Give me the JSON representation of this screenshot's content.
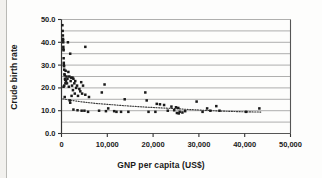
{
  "chart_data": {
    "type": "scatter",
    "title": "",
    "xlabel": "GNP per capita (US$)",
    "ylabel": "Crude birth rate",
    "xlim": [
      0,
      50000
    ],
    "ylim": [
      0,
      50
    ],
    "xticks": [
      0,
      10000,
      20000,
      30000,
      40000,
      50000
    ],
    "xticklabels": [
      "0",
      "10,000",
      "20,000",
      "30,000",
      "40,000",
      "50,000"
    ],
    "yticks": [
      0,
      10,
      20,
      30,
      40,
      50
    ],
    "yticklabels": [
      "0.0",
      "10.0",
      "20.0",
      "30.0",
      "40.0",
      "50.0"
    ],
    "grid": "horizontal gridlines every 5 units",
    "gridlines_y": [
      5,
      10,
      15,
      20,
      25,
      30,
      35,
      40,
      45,
      50
    ],
    "marker": "filled-square",
    "marker_color": "#1a1a1a",
    "legend": "none",
    "series": [
      {
        "name": "Countries",
        "points": [
          [
            200,
            47.5
          ],
          [
            250,
            45.0
          ],
          [
            300,
            43.0
          ],
          [
            320,
            41.5
          ],
          [
            350,
            41.0
          ],
          [
            380,
            40.0
          ],
          [
            1400,
            40.0
          ],
          [
            400,
            38.0
          ],
          [
            5200,
            38.0
          ],
          [
            420,
            37.0
          ],
          [
            450,
            36.5
          ],
          [
            1900,
            35.0
          ],
          [
            470,
            33.0
          ],
          [
            500,
            31.0
          ],
          [
            520,
            30.0
          ],
          [
            560,
            29.5
          ],
          [
            600,
            28.0
          ],
          [
            900,
            27.5
          ],
          [
            1500,
            27.0
          ],
          [
            650,
            26.0
          ],
          [
            700,
            25.5
          ],
          [
            1100,
            25.0
          ],
          [
            1700,
            25.0
          ],
          [
            2100,
            24.5
          ],
          [
            2400,
            24.5
          ],
          [
            750,
            24.0
          ],
          [
            1300,
            24.0
          ],
          [
            2600,
            24.0
          ],
          [
            800,
            23.5
          ],
          [
            1000,
            23.0
          ],
          [
            2000,
            23.0
          ],
          [
            3000,
            23.0
          ],
          [
            4300,
            22.5
          ],
          [
            850,
            22.0
          ],
          [
            1200,
            22.0
          ],
          [
            2800,
            22.0
          ],
          [
            9400,
            21.5
          ],
          [
            600,
            21.0
          ],
          [
            2300,
            21.0
          ],
          [
            3400,
            21.0
          ],
          [
            4700,
            21.0
          ],
          [
            450,
            20.5
          ],
          [
            1600,
            20.5
          ],
          [
            3200,
            20.0
          ],
          [
            3900,
            19.5
          ],
          [
            2500,
            19.0
          ],
          [
            4100,
            18.5
          ],
          [
            8800,
            18.0
          ],
          [
            18300,
            18.0
          ],
          [
            2900,
            17.5
          ],
          [
            4500,
            17.5
          ],
          [
            5200,
            17.0
          ],
          [
            2200,
            16.5
          ],
          [
            3600,
            16.5
          ],
          [
            700,
            16.0
          ],
          [
            6000,
            16.0
          ],
          [
            13800,
            15.0
          ],
          [
            1800,
            14.5
          ],
          [
            18600,
            14.5
          ],
          [
            29500,
            14.0
          ],
          [
            20800,
            13.0
          ],
          [
            21500,
            12.8
          ],
          [
            22400,
            12.5
          ],
          [
            33800,
            12.0
          ],
          [
            24000,
            11.8
          ],
          [
            25000,
            11.5
          ],
          [
            25500,
            11.2
          ],
          [
            43200,
            11.0
          ],
          [
            31800,
            11.0
          ],
          [
            10200,
            11.0
          ],
          [
            2600,
            10.5
          ],
          [
            3500,
            10.2
          ],
          [
            4400,
            10.0
          ],
          [
            5000,
            10.0
          ],
          [
            8200,
            10.0
          ],
          [
            9700,
            9.8
          ],
          [
            11500,
            9.8
          ],
          [
            13000,
            9.5
          ],
          [
            14600,
            9.5
          ],
          [
            20500,
            9.5
          ],
          [
            23200,
            10.0
          ],
          [
            24600,
            10.2
          ],
          [
            25200,
            9.0
          ],
          [
            25800,
            9.5
          ],
          [
            26400,
            9.2
          ],
          [
            27000,
            9.8
          ],
          [
            30800,
            9.5
          ],
          [
            32500,
            10.0
          ],
          [
            34500,
            10.0
          ],
          [
            40300,
            9.5
          ],
          [
            5800,
            9.5
          ],
          [
            1900,
            13.5
          ],
          [
            12000,
            9.5
          ],
          [
            19000,
            9.5
          ],
          [
            25600,
            8.8
          ]
        ]
      }
    ],
    "trendline": {
      "style": "dotted",
      "color": "#3a3a3a",
      "points": [
        [
          300,
          15.2
        ],
        [
          2000,
          14.6
        ],
        [
          4000,
          14.0
        ],
        [
          6000,
          13.5
        ],
        [
          8000,
          13.1
        ],
        [
          10000,
          12.8
        ],
        [
          13000,
          12.3
        ],
        [
          16000,
          11.9
        ],
        [
          19000,
          11.5
        ],
        [
          22000,
          11.2
        ],
        [
          25000,
          10.9
        ],
        [
          28000,
          10.5
        ],
        [
          31000,
          10.2
        ],
        [
          34000,
          9.9
        ],
        [
          37000,
          9.7
        ],
        [
          40000,
          9.5
        ],
        [
          43500,
          9.4
        ]
      ]
    }
  }
}
